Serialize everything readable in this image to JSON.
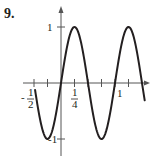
{
  "problem": {
    "number": "9."
  },
  "chart_data": {
    "type": "line",
    "title": "",
    "xlabel": "",
    "ylabel": "",
    "function": "y = sin(2πx)",
    "xlim": [
      -0.5,
      1.55
    ],
    "ylim": [
      -1.05,
      1.05
    ],
    "grid": false,
    "legend": null,
    "x_ticks": [
      -0.5,
      -0.25,
      0.25,
      0.5,
      0.75,
      1,
      1.25
    ],
    "x_tick_labels": [
      {
        "value": -0.5,
        "text_sign": "-",
        "num": "1",
        "den": "2"
      },
      {
        "value": 0.25,
        "text_sign": "",
        "num": "1",
        "den": "4"
      },
      {
        "value": 1,
        "text": "1"
      }
    ],
    "y_ticks": [
      1,
      -1
    ],
    "y_tick_labels": [
      {
        "value": 1,
        "text": "1"
      },
      {
        "value": -1,
        "text": "-1"
      }
    ],
    "series": [
      {
        "name": "curve",
        "x": [
          -0.48,
          -0.375,
          -0.25,
          -0.125,
          0,
          0.125,
          0.25,
          0.375,
          0.5,
          0.625,
          0.75,
          0.875,
          1,
          1.125,
          1.25,
          1.375,
          1.5,
          1.55
        ],
        "y": [
          0.13,
          -0.71,
          -1,
          -0.71,
          0,
          0.71,
          1,
          0.71,
          0,
          -0.71,
          -1,
          -0.71,
          0,
          0.71,
          1,
          0.71,
          0,
          -0.31
        ]
      }
    ]
  },
  "labels": {
    "y_one": "1",
    "y_neg_one": "-1",
    "x_neg_half_sign": "-",
    "x_neg_half_num": "1",
    "x_neg_half_den": "2",
    "x_quarter_num": "1",
    "x_quarter_den": "4",
    "x_one": "1"
  },
  "colors": {
    "ink": "#231f20",
    "axis": "#555555"
  }
}
